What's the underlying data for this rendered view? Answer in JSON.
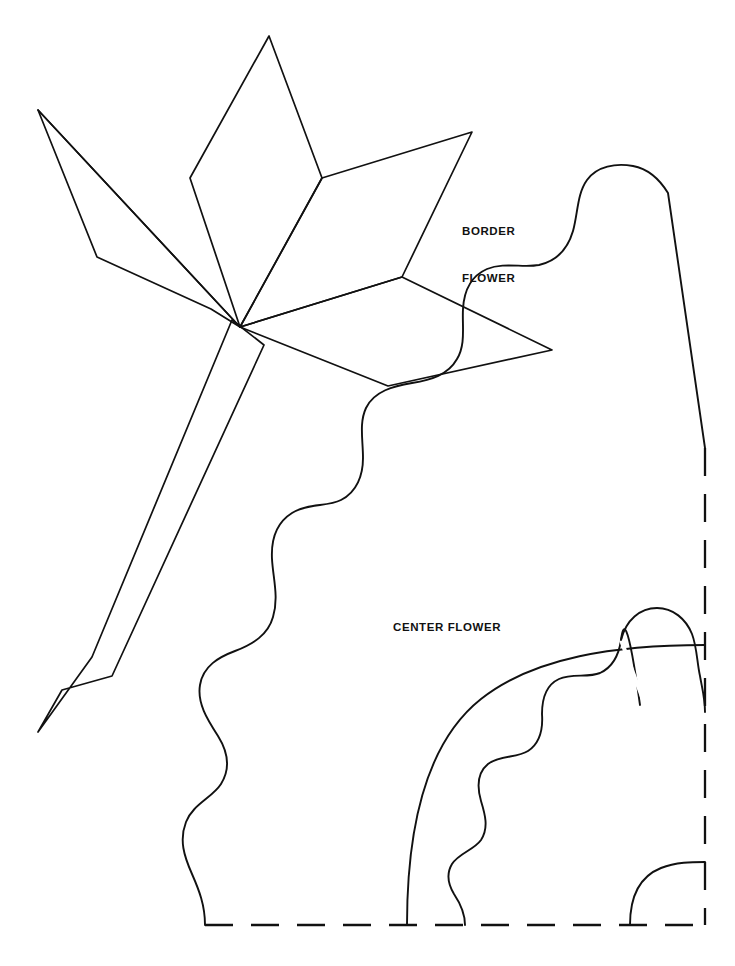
{
  "document": {
    "kind": "sewing-pattern-template",
    "background_color": "#ffffff",
    "ink_color": "#111111",
    "width": 735,
    "height": 966
  },
  "labels": {
    "border_flower": "BORDER\nFLOWER",
    "border_flower_line1": "BORDER",
    "border_flower_line2": "FLOWER",
    "center_flower": "CENTER FLOWER"
  },
  "shapes": {
    "border_flower": {
      "name": "border-flower-motif",
      "description": "Angular five-petal flower with long tapered stem",
      "petals": [
        {
          "name": "top-petal",
          "apex": [
            269,
            36
          ],
          "left_shoulder": [
            190,
            178
          ],
          "right_shoulder": [
            322,
            178
          ],
          "base": [
            240,
            327
          ]
        },
        {
          "name": "upper-right-petal",
          "tip": [
            472,
            132
          ],
          "inner": [
            402,
            277
          ],
          "base": [
            240,
            327
          ]
        },
        {
          "name": "lower-right-petal",
          "tip": [
            552,
            350
          ],
          "inner": [
            402,
            277
          ],
          "base": [
            240,
            327
          ],
          "lower_corner": [
            388,
            386
          ]
        },
        {
          "name": "left-petal",
          "tip": [
            38,
            110
          ],
          "bend": [
            97,
            257
          ],
          "notch": [
            211,
            309
          ],
          "base": [
            240,
            327
          ]
        }
      ],
      "stem": {
        "name": "flower-stem",
        "top": [
          240,
          327
        ],
        "tip": [
          38,
          732
        ],
        "left_edge_bend": [
          92,
          657
        ],
        "right_edge_bend": [
          112,
          676
        ],
        "stroke_width": 1.6
      }
    },
    "center_flower": {
      "name": "center-flower-motif",
      "description": "Large scalloped quarter-panel outline with dashed fold lines",
      "outer_wave_start": [
        205,
        925
      ],
      "outer_wave_peak": [
        635,
        405
      ],
      "outer_corner": [
        705,
        448
      ],
      "inner_arc": {
        "name": "smooth-quarter-arc",
        "start": [
          407,
          925
        ],
        "end": [
          705,
          645
        ]
      },
      "scallop_arc": {
        "name": "scalloped-inner-arc",
        "start": [
          465,
          925
        ],
        "end": [
          705,
          712
        ]
      },
      "corner_arc": {
        "name": "small-corner-arc",
        "start": [
          630,
          925
        ],
        "end": [
          705,
          862
        ]
      }
    },
    "fold_lines": {
      "name": "dashed-fold-lines",
      "vertical_x": 705,
      "horizontal_y": 925,
      "dash_pattern": "26 16",
      "stroke_width": 2.2,
      "color": "#111111"
    }
  }
}
